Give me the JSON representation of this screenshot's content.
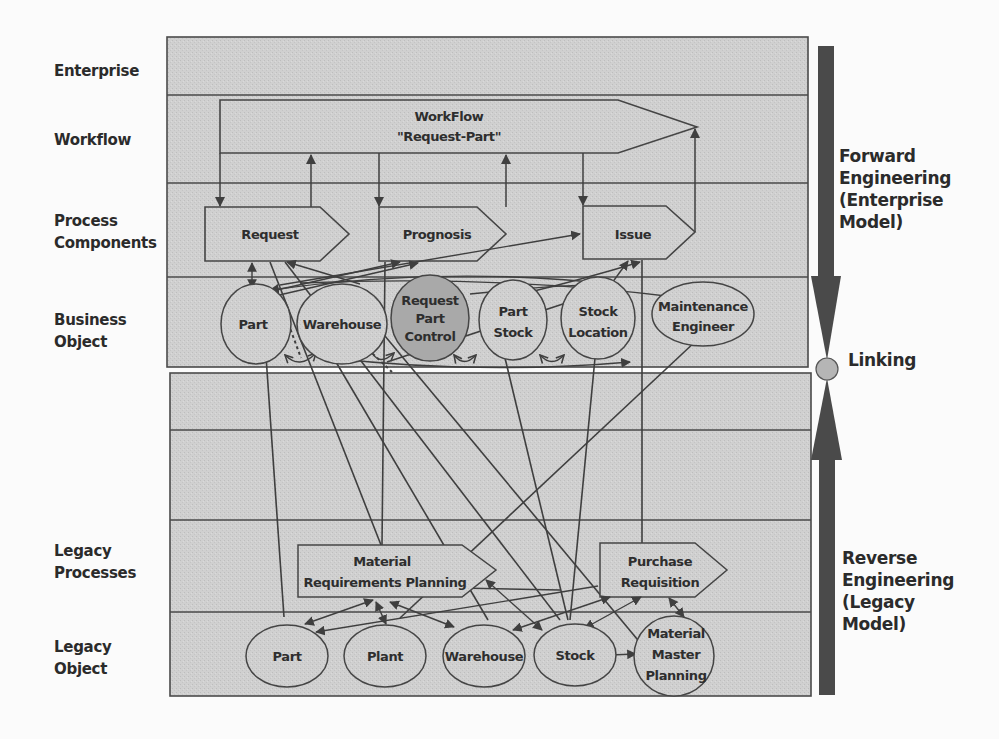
{
  "diagram": {
    "type": "layered-architecture",
    "row_labels": [
      {
        "id": "enterprise",
        "text": [
          "Enterprise"
        ]
      },
      {
        "id": "workflow",
        "text": [
          "Workflow"
        ]
      },
      {
        "id": "process-components",
        "text": [
          "Process",
          "Components"
        ]
      },
      {
        "id": "business-object",
        "text": [
          "Business",
          "Object"
        ]
      },
      {
        "id": "legacy-processes",
        "text": [
          "Legacy",
          "Processes"
        ]
      },
      {
        "id": "legacy-object",
        "text": [
          "Legacy",
          "Object"
        ]
      }
    ],
    "workflow": {
      "line1": "WorkFlow",
      "line2": "\"Request-Part\""
    },
    "process_components": [
      {
        "id": "request",
        "label": "Request"
      },
      {
        "id": "prognosis",
        "label": "Prognosis"
      },
      {
        "id": "issue",
        "label": "Issue"
      }
    ],
    "business_objects": [
      {
        "id": "part",
        "lines": [
          "Part"
        ]
      },
      {
        "id": "warehouse",
        "lines": [
          "Warehouse"
        ]
      },
      {
        "id": "request-part-control",
        "lines": [
          "Request",
          "Part",
          "Control"
        ],
        "highlighted": true
      },
      {
        "id": "part-stock",
        "lines": [
          "Part",
          "Stock"
        ]
      },
      {
        "id": "stock-location",
        "lines": [
          "Stock",
          "Location"
        ]
      },
      {
        "id": "maintenance-engineer",
        "lines": [
          "Maintenance",
          "Engineer"
        ]
      }
    ],
    "legacy_processes": [
      {
        "id": "mrp",
        "lines": [
          "Material",
          "Requirements Planning"
        ]
      },
      {
        "id": "purchase-requisition",
        "lines": [
          "Purchase",
          "Requisition"
        ]
      }
    ],
    "legacy_objects": [
      {
        "id": "legacy-part",
        "lines": [
          "Part"
        ]
      },
      {
        "id": "legacy-plant",
        "lines": [
          "Plant"
        ]
      },
      {
        "id": "legacy-warehouse",
        "lines": [
          "Warehouse"
        ]
      },
      {
        "id": "legacy-stock",
        "lines": [
          "Stock"
        ]
      },
      {
        "id": "legacy-mmp",
        "lines": [
          "Material",
          "Master",
          "Planning"
        ]
      }
    ],
    "side": {
      "forward": [
        "Forward",
        "Engineering",
        "(Enterprise",
        "Model)"
      ],
      "linking": "Linking",
      "reverse": [
        "Reverse",
        "Engineering",
        "(Legacy",
        "Model)"
      ]
    },
    "colors": {
      "band_fill": "#cfcfcf",
      "line": "#454545",
      "highlight_fill": "#a9a9a9",
      "bar": "#4a4a4a",
      "linking_dot": "#b5b5b5"
    }
  }
}
